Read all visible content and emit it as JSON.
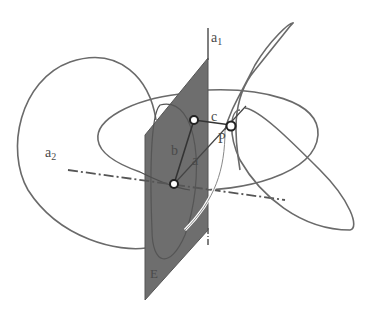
{
  "figure": {
    "labels": {
      "a1": "a",
      "a1_sub": "1",
      "a2": "a",
      "a2_sub": "2",
      "a": "a",
      "b": "b",
      "c": "c",
      "P": "P",
      "E": "E"
    },
    "colors": {
      "plane_fill": "#6e6e6e",
      "curve_stroke": "#6a6a6a",
      "axis_stroke": "#555555",
      "background": "#ffffff"
    }
  }
}
